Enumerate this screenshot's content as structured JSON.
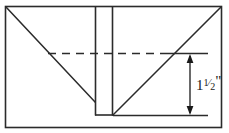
{
  "figure": {
    "type": "line-drawing",
    "width": 229,
    "height": 133,
    "background_color": "#ffffff",
    "line_color": "#2b2b2b"
  },
  "annotations": {
    "dimension": {
      "name": "depth-dimension",
      "whole": "1",
      "fraction_numerator": "1",
      "fraction_denominator": "2",
      "unit_mark": "\"",
      "full_label": "1 1/2\"",
      "value_inches": 1.5,
      "arrow_style": "double-headed-vertical"
    }
  },
  "geometry": {
    "outer_rectangle": {
      "x": 5,
      "y": 6,
      "width": 217,
      "height": 122
    },
    "channel": {
      "left_x": 95,
      "right_x": 112,
      "top_y": 6,
      "bottom_y": 115
    },
    "left_diagonal": {
      "x1": 6,
      "y1": 7,
      "x2": 95,
      "y2": 102
    },
    "right_diagonal": {
      "x1": 113,
      "y1": 115,
      "x2": 221,
      "y2": 7
    },
    "dashed_reference_line": {
      "y": 53,
      "x1": 48,
      "x2": 172,
      "style": "dashed"
    },
    "upper_extension_line": {
      "y": 53,
      "x1": 168,
      "x2": 208
    },
    "lower_extension_line": {
      "y": 115,
      "x1": 113,
      "x2": 208
    },
    "dimension_arrow": {
      "x": 190,
      "y_top": 55,
      "y_bottom": 114
    }
  }
}
